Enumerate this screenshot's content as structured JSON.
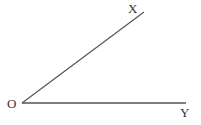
{
  "diagram": {
    "type": "angle",
    "vertex": {
      "label": "O",
      "x": 22,
      "y": 103
    },
    "rays": [
      {
        "label": "X",
        "end_x": 144,
        "end_y": 12
      },
      {
        "label": "Y",
        "end_x": 186,
        "end_y": 103
      }
    ],
    "line_color": "#555555",
    "label_color": "#333333"
  }
}
